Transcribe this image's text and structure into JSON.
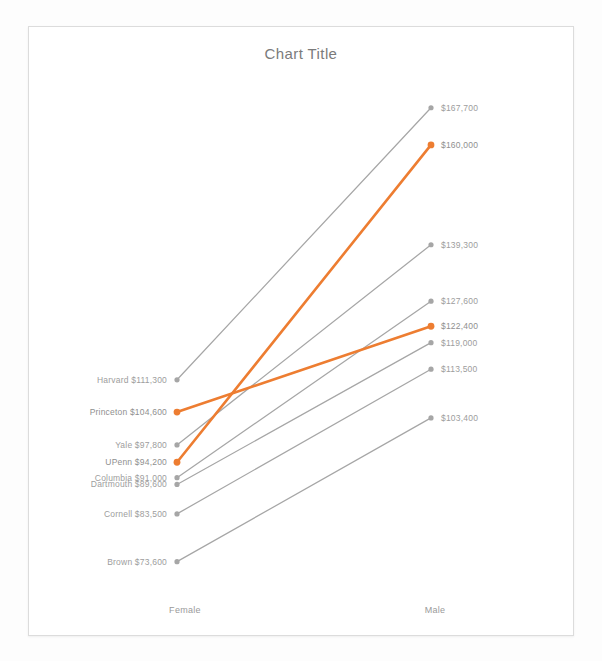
{
  "chart": {
    "title": "Chart Title",
    "background": "#ffffff",
    "frame_color": "#dcdcdc",
    "default_color": "#a6a6a6",
    "highlight_color": "#ed7d31",
    "label_color": "#9d9d9d"
  },
  "chart_data": {
    "type": "line",
    "title": "Chart Title",
    "subtitle": "",
    "xlabel": "",
    "ylabel": "",
    "grid": false,
    "legend": "none",
    "categories": [
      "Female",
      "Male"
    ],
    "x": [
      "Female",
      "Male"
    ],
    "ylim": [
      70000,
      172000
    ],
    "series": [
      {
        "name": "Harvard",
        "values": [
          111300,
          167700
        ],
        "left_label": "Harvard  $111,300",
        "right_label": "$167,700",
        "highlight": false,
        "color": "#a6a6a6"
      },
      {
        "name": "Princeton",
        "values": [
          104600,
          122400
        ],
        "left_label": "Princeton  $104,600",
        "right_label": "$122,400",
        "highlight": true,
        "color": "#ed7d31"
      },
      {
        "name": "Yale",
        "values": [
          97800,
          139300
        ],
        "left_label": "Yale  $97,800",
        "right_label": "$139,300",
        "highlight": false,
        "color": "#a6a6a6"
      },
      {
        "name": "UPenn",
        "values": [
          94200,
          160000
        ],
        "left_label": "UPenn  $94,200",
        "right_label": "$160,000",
        "highlight": true,
        "color": "#ed7d31"
      },
      {
        "name": "Columbia",
        "values": [
          91000,
          127600
        ],
        "left_label": "Columbia  $91,000",
        "right_label": "$127,600",
        "highlight": false,
        "color": "#a6a6a6"
      },
      {
        "name": "Dartmouth",
        "values": [
          89600,
          119000
        ],
        "left_label": "Dartmouth  $89,600",
        "right_label": "$119,000",
        "highlight": false,
        "color": "#a6a6a6"
      },
      {
        "name": "Cornell",
        "values": [
          83500,
          113500
        ],
        "left_label": "Cornell  $83,500",
        "right_label": "$113,500",
        "highlight": false,
        "color": "#a6a6a6"
      },
      {
        "name": "Brown",
        "values": [
          73600,
          103400
        ],
        "left_label": "Brown  $73,600",
        "right_label": "$103,400",
        "highlight": false,
        "color": "#a6a6a6"
      }
    ],
    "axis_labels": {
      "left": "Female",
      "right": "Male"
    }
  }
}
